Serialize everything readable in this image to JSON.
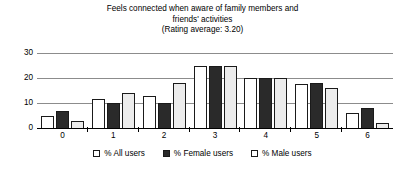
{
  "chart_data": {
    "type": "bar",
    "title": "Feels connected when aware of family members and friends' activities",
    "title_lines": [
      "Feels connected when aware of family members and",
      "friends' activities",
      "(Rating average: 3.20)"
    ],
    "subtitle": "(Rating average: 3.20)",
    "rating_average": "3.20",
    "xlabel": "",
    "ylabel": "",
    "categories": [
      "0",
      "1",
      "2",
      "3",
      "4",
      "5",
      "6"
    ],
    "yticks": [
      "30",
      "20",
      "10",
      "0"
    ],
    "ylim": [
      0,
      30
    ],
    "grid": true,
    "legend_position": "bottom",
    "series": [
      {
        "name": "% All users",
        "color": "#ffffff",
        "values": [
          5,
          11.5,
          13,
          25,
          20,
          17.5,
          6
        ]
      },
      {
        "name": "% Female users",
        "color": "#2a2a2a",
        "values": [
          7,
          10,
          10,
          25,
          20,
          18,
          8
        ]
      },
      {
        "name": "% Male users",
        "color": "#ececec",
        "values": [
          3,
          14,
          18,
          25,
          20,
          16,
          2
        ]
      }
    ]
  }
}
